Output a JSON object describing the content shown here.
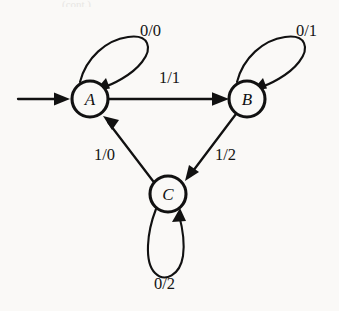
{
  "diagram": {
    "background_color": "#faf9f7",
    "stroke_color": "#111111",
    "cropped_caption": "(cont.)",
    "states": [
      {
        "id": "A",
        "label": "A",
        "cx": 90,
        "cy": 99,
        "r": 18,
        "is_start": true
      },
      {
        "id": "B",
        "label": "B",
        "cx": 247,
        "cy": 99,
        "r": 18,
        "is_start": false
      },
      {
        "id": "C",
        "label": "C",
        "cx": 168,
        "cy": 194,
        "r": 18,
        "is_start": false
      }
    ],
    "transitions": [
      {
        "from": "A",
        "to": "A",
        "input": "0",
        "output": "0",
        "label": "0/0",
        "kind": "self-loop",
        "label_x": 140,
        "label_y": 23
      },
      {
        "from": "B",
        "to": "B",
        "input": "0",
        "output": "1",
        "label": "0/1",
        "kind": "self-loop",
        "label_x": 296,
        "label_y": 23
      },
      {
        "from": "C",
        "to": "C",
        "input": "0",
        "output": "2",
        "label": "0/2",
        "kind": "self-loop",
        "label_x": 154,
        "label_y": 276
      },
      {
        "from": "A",
        "to": "B",
        "input": "1",
        "output": "1",
        "label": "1/1",
        "kind": "edge",
        "label_x": 159,
        "label_y": 70
      },
      {
        "from": "B",
        "to": "C",
        "input": "1",
        "output": "2",
        "label": "1/2",
        "kind": "edge",
        "label_x": 215,
        "label_y": 147
      },
      {
        "from": "C",
        "to": "A",
        "input": "1",
        "output": "0",
        "label": "1/0",
        "kind": "edge",
        "label_x": 94,
        "label_y": 147
      }
    ],
    "start_arrow": {
      "from_x": 18,
      "to_x": 70,
      "y": 99
    }
  }
}
